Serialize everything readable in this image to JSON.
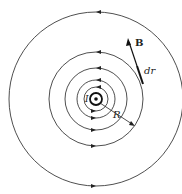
{
  "diagram": {
    "center": [
      96,
      99
    ],
    "circle_radii": [
      87,
      47,
      31,
      19
    ],
    "wire_radius": 7,
    "labels": {
      "current": "I",
      "radius": "R",
      "field": "B",
      "displacement": "dr"
    },
    "colors": {
      "line": "#222222",
      "background": "#ffffff"
    }
  }
}
